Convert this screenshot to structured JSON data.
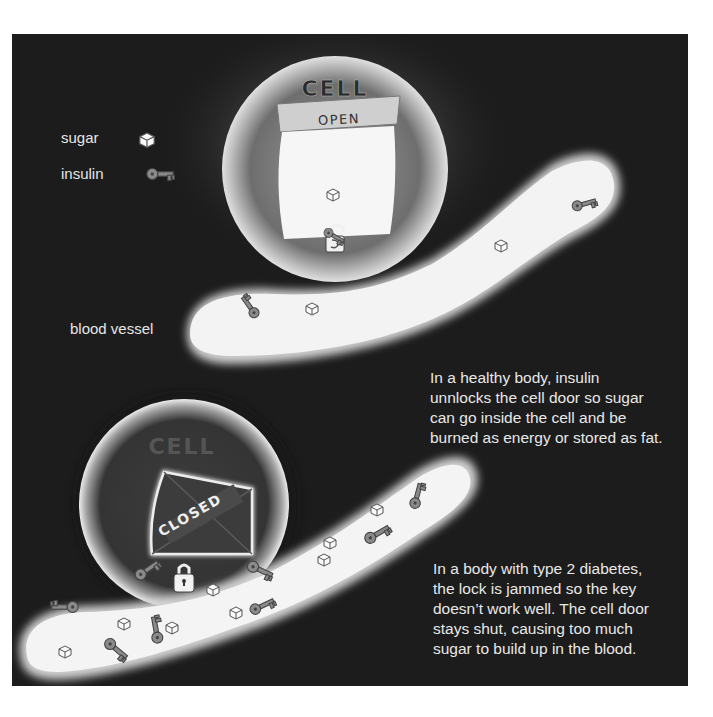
{
  "legend": {
    "sugar_label": "sugar",
    "sugar_icon": "sugar-cube-icon",
    "insulin_label": "insulin",
    "insulin_icon": "key-icon"
  },
  "labels": {
    "blood_vessel": "blood vessel"
  },
  "healthy_cell": {
    "title": "CELL",
    "door_sign": "OPEN",
    "lock_icon": "open-padlock-icon"
  },
  "diabetic_cell": {
    "title": "CELL",
    "door_sign": "CLOSED",
    "lock_icon": "closed-padlock-icon"
  },
  "captions": {
    "healthy": [
      "In a healthy body, insulin",
      "unnlocks the cell door so sugar",
      "can go inside the cell and be",
      "burned as energy or stored as fat."
    ],
    "diabetes": [
      "In a body with type 2 diabetes,",
      "the lock is jammed so the key",
      "doesn’t work well. The cell door",
      "stays shut, causing too much",
      "sugar to build up in the blood."
    ]
  },
  "colors": {
    "background": "#1c1c1c",
    "vessel": "#f2f2f2",
    "text": "#e6e6e6",
    "key": "#8a8a8a"
  }
}
